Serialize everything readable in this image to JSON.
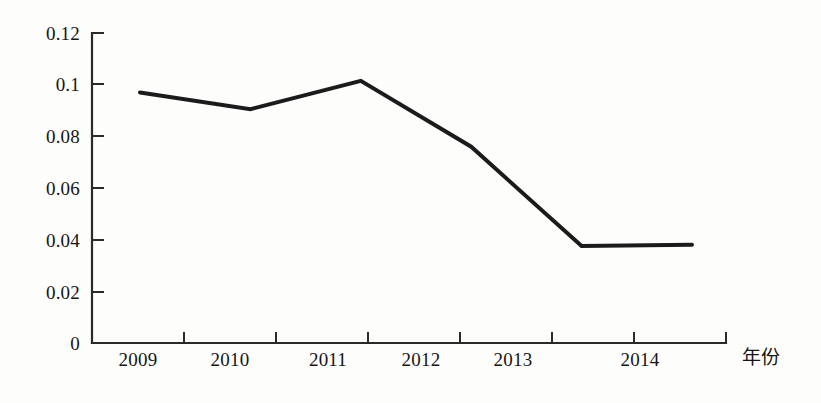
{
  "chart_data": {
    "type": "line",
    "title": "",
    "subtitle": "",
    "xlabel": "年份",
    "ylabel": "",
    "categories": [
      "2009",
      "2010",
      "2011",
      "2012",
      "2013",
      "2014"
    ],
    "values": [
      0.097,
      0.0905,
      0.1015,
      0.076,
      0.0375,
      0.038
    ],
    "series": [
      {
        "name": "",
        "values": [
          0.097,
          0.0905,
          0.1015,
          0.076,
          0.0375,
          0.038
        ]
      }
    ],
    "xlim": [
      2008.5,
      2014.5
    ],
    "ylim": [
      0,
      0.12
    ],
    "ytick_labels": [
      "0.12",
      "0.1",
      "0.08",
      "0.06",
      "0.04",
      "0.02",
      "0"
    ],
    "ytick_values": [
      0.12,
      0.1,
      0.08,
      0.06,
      0.04,
      0.02,
      0
    ],
    "xtick_labels": [
      "2009",
      "2010",
      "2011",
      "2012",
      "2013",
      "2014"
    ],
    "grid": false,
    "legend": false,
    "legend_position": "none",
    "line_color": "#1b1b1b",
    "axis_color": "#2a2a2a",
    "background_color": "#fdfdfc",
    "line_width": 4
  },
  "axes": {
    "x_axis_title": "年份"
  }
}
